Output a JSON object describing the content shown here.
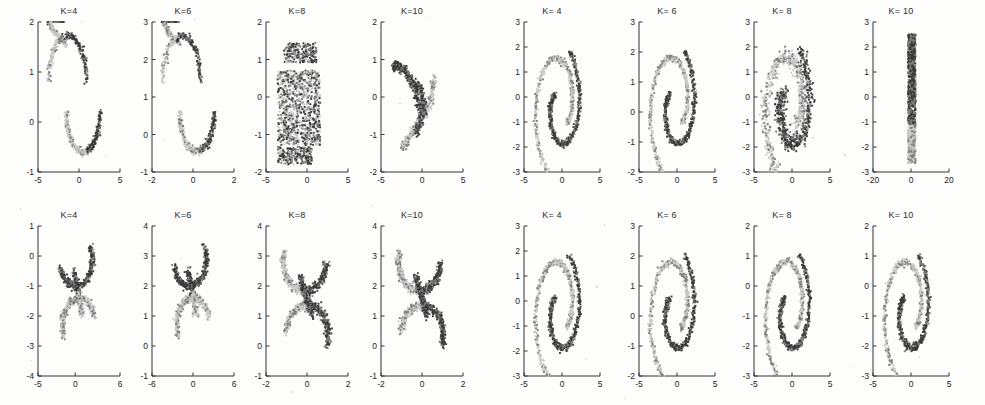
{
  "figure": {
    "background": "#fdfdfc",
    "width": 985,
    "height": 405,
    "groups": [
      {
        "id": "group-left",
        "name": "two-moons-clustering-group"
      },
      {
        "id": "group-right",
        "name": "spiral-clustering-group"
      }
    ]
  },
  "colors": {
    "dark_cluster": "#3a3a3a",
    "mid_cluster": "#7d7d7d",
    "light_cluster": "#c9c9c9",
    "axis": "#333333",
    "text": "#232323",
    "background": "#fdfdfc"
  },
  "chart_data": [
    {
      "id": "left-r0c0",
      "type": "scatter",
      "title": "K=4",
      "xlabel": "",
      "ylabel": "",
      "xlim": [
        -5,
        5
      ],
      "ylim": [
        -1,
        2
      ],
      "xticks": [
        -5,
        0,
        5
      ],
      "yticks": [
        -1,
        0,
        1,
        2
      ],
      "grid": false,
      "legend": "none",
      "shape": "two-moons",
      "series": [
        {
          "name": "cluster-dark",
          "color": "#3a3a3a",
          "points": 220
        },
        {
          "name": "cluster-light",
          "color": "#c9c9c9",
          "points": 220
        }
      ]
    },
    {
      "id": "left-r0c1",
      "type": "scatter",
      "title": "K=6",
      "xlabel": "",
      "ylabel": "",
      "xlim": [
        -2,
        2
      ],
      "ylim": [
        -1,
        3
      ],
      "xticks": [
        -2,
        0,
        2
      ],
      "yticks": [
        -1,
        0,
        1,
        2,
        3
      ],
      "grid": false,
      "legend": "none",
      "shape": "two-moons",
      "series": [
        {
          "name": "cluster-dark",
          "color": "#3a3a3a",
          "points": 220
        },
        {
          "name": "cluster-light",
          "color": "#c9c9c9",
          "points": 220
        }
      ]
    },
    {
      "id": "left-r0c2",
      "type": "scatter",
      "title": "K=8",
      "xlabel": "",
      "ylabel": "",
      "xlim": [
        -5,
        5
      ],
      "ylim": [
        -2,
        2
      ],
      "xticks": [
        -5,
        0,
        5
      ],
      "yticks": [
        -2,
        -1,
        0,
        1,
        2
      ],
      "grid": false,
      "legend": "none",
      "shape": "noise-blob",
      "series": [
        {
          "name": "cluster-dark",
          "color": "#3a3a3a",
          "points": 600
        },
        {
          "name": "cluster-light",
          "color": "#c9c9c9",
          "points": 600
        }
      ]
    },
    {
      "id": "left-r0c3",
      "type": "scatter",
      "title": "K=10",
      "xlabel": "",
      "ylabel": "",
      "xlim": [
        -5,
        5
      ],
      "ylim": [
        -2,
        2
      ],
      "xticks": [
        -5,
        0,
        5
      ],
      "yticks": [
        -2,
        -1,
        0,
        1,
        2
      ],
      "grid": false,
      "legend": "none",
      "shape": "two-moons-tilted",
      "series": [
        {
          "name": "cluster-dark",
          "color": "#3a3a3a",
          "points": 260
        },
        {
          "name": "cluster-light",
          "color": "#c9c9c9",
          "points": 260
        }
      ]
    },
    {
      "id": "left-r1c0",
      "type": "scatter",
      "title": "K=4",
      "xlabel": "",
      "ylabel": "",
      "xlim": [
        -5,
        6
      ],
      "ylim": [
        -4,
        1
      ],
      "xticks": [
        -5,
        0,
        6
      ],
      "yticks": [
        -4,
        -3,
        -2,
        -1,
        0,
        1
      ],
      "grid": false,
      "legend": "none",
      "shape": "s-curve",
      "series": [
        {
          "name": "cluster-dark",
          "color": "#3a3a3a",
          "points": 220
        },
        {
          "name": "cluster-light",
          "color": "#c9c9c9",
          "points": 220
        }
      ]
    },
    {
      "id": "left-r1c1",
      "type": "scatter",
      "title": "K=6",
      "xlabel": "",
      "ylabel": "",
      "xlim": [
        -6,
        6
      ],
      "ylim": [
        -1,
        4
      ],
      "xticks": [
        -6,
        0,
        6
      ],
      "yticks": [
        -1,
        0,
        1,
        2,
        3,
        4
      ],
      "grid": false,
      "legend": "none",
      "shape": "s-curve",
      "series": [
        {
          "name": "cluster-dark",
          "color": "#3a3a3a",
          "points": 220
        },
        {
          "name": "cluster-light",
          "color": "#c9c9c9",
          "points": 220
        }
      ]
    },
    {
      "id": "left-r1c2",
      "type": "scatter",
      "title": "K=8",
      "xlabel": "",
      "ylabel": "",
      "xlim": [
        -2,
        2
      ],
      "ylim": [
        -1,
        4
      ],
      "xticks": [
        -2,
        0,
        2
      ],
      "yticks": [
        -1,
        0,
        1,
        2,
        3,
        4
      ],
      "grid": false,
      "legend": "none",
      "shape": "s-curve-wide",
      "series": [
        {
          "name": "cluster-dark",
          "color": "#3a3a3a",
          "points": 300
        },
        {
          "name": "cluster-light",
          "color": "#c9c9c9",
          "points": 300
        }
      ]
    },
    {
      "id": "left-r1c3",
      "type": "scatter",
      "title": "K=10",
      "xlabel": "",
      "ylabel": "",
      "xlim": [
        -2,
        2
      ],
      "ylim": [
        -1,
        4
      ],
      "xticks": [
        -2,
        0,
        2
      ],
      "yticks": [
        -1,
        0,
        1,
        2,
        3,
        4
      ],
      "grid": false,
      "legend": "none",
      "shape": "s-curve-wide",
      "series": [
        {
          "name": "cluster-dark",
          "color": "#3a3a3a",
          "points": 300
        },
        {
          "name": "cluster-light",
          "color": "#c9c9c9",
          "points": 300
        }
      ]
    },
    {
      "id": "right-r0c0",
      "type": "scatter",
      "title": "K= 4",
      "xlabel": "",
      "ylabel": "",
      "xlim": [
        -5,
        5
      ],
      "ylim": [
        -3,
        3
      ],
      "xticks": [
        -5,
        0,
        5
      ],
      "yticks": [
        -3,
        -2,
        -1,
        0,
        1,
        2,
        3
      ],
      "grid": false,
      "legend": "none",
      "shape": "spiral-2arm",
      "series": [
        {
          "name": "cluster-dark",
          "color": "#3a3a3a",
          "points": 320
        },
        {
          "name": "cluster-light",
          "color": "#c9c9c9",
          "points": 320
        }
      ]
    },
    {
      "id": "right-r0c1",
      "type": "scatter",
      "title": "K= 6",
      "xlabel": "",
      "ylabel": "",
      "xlim": [
        -5,
        5
      ],
      "ylim": [
        -2,
        3
      ],
      "xticks": [
        -5,
        0,
        5
      ],
      "yticks": [
        -2,
        -1,
        0,
        1,
        2,
        3
      ],
      "grid": false,
      "legend": "none",
      "shape": "spiral-2arm",
      "series": [
        {
          "name": "cluster-dark",
          "color": "#3a3a3a",
          "points": 320
        },
        {
          "name": "cluster-light",
          "color": "#c9c9c9",
          "points": 320
        }
      ]
    },
    {
      "id": "right-r0c2",
      "type": "scatter",
      "title": "K= 8",
      "xlabel": "",
      "ylabel": "",
      "xlim": [
        -5,
        5
      ],
      "ylim": [
        -3,
        3
      ],
      "xticks": [
        -5,
        0,
        5
      ],
      "yticks": [
        -3,
        -2,
        -1,
        0,
        1,
        2,
        3
      ],
      "grid": false,
      "legend": "none",
      "shape": "spiral-2arm-noisy",
      "series": [
        {
          "name": "cluster-dark",
          "color": "#3a3a3a",
          "points": 420
        },
        {
          "name": "cluster-light",
          "color": "#c9c9c9",
          "points": 420
        }
      ]
    },
    {
      "id": "right-r0c3",
      "type": "scatter",
      "title": "K= 10",
      "xlabel": "",
      "ylabel": "",
      "xlim": [
        -20,
        20
      ],
      "ylim": [
        -3,
        3
      ],
      "xticks": [
        -20,
        0,
        20
      ],
      "yticks": [
        -3,
        -2,
        -1,
        0,
        1,
        2,
        3
      ],
      "grid": false,
      "legend": "none",
      "shape": "vertical-band",
      "series": [
        {
          "name": "cluster-dark",
          "color": "#3a3a3a",
          "points": 700
        },
        {
          "name": "cluster-light",
          "color": "#c9c9c9",
          "points": 700
        }
      ]
    },
    {
      "id": "right-r1c0",
      "type": "scatter",
      "title": "K= 4",
      "xlabel": "",
      "ylabel": "",
      "xlim": [
        -5,
        5
      ],
      "ylim": [
        -3,
        3
      ],
      "xticks": [
        -5,
        0,
        5
      ],
      "yticks": [
        -3,
        -2,
        -1,
        0,
        1,
        2,
        3
      ],
      "grid": false,
      "legend": "none",
      "shape": "spiral-2arm-clean",
      "series": [
        {
          "name": "cluster-dark",
          "color": "#3a3a3a",
          "points": 320
        },
        {
          "name": "cluster-light",
          "color": "#c9c9c9",
          "points": 320
        }
      ]
    },
    {
      "id": "right-r1c1",
      "type": "scatter",
      "title": "K= 6",
      "xlabel": "",
      "ylabel": "",
      "xlim": [
        -5,
        5
      ],
      "ylim": [
        -2,
        3
      ],
      "xticks": [
        -5,
        0,
        5
      ],
      "yticks": [
        -2,
        -1,
        0,
        1,
        2,
        3
      ],
      "grid": false,
      "legend": "none",
      "shape": "spiral-2arm-clean",
      "series": [
        {
          "name": "cluster-dark",
          "color": "#3a3a3a",
          "points": 320
        },
        {
          "name": "cluster-light",
          "color": "#c9c9c9",
          "points": 320
        }
      ]
    },
    {
      "id": "right-r1c2",
      "type": "scatter",
      "title": "K= 8",
      "xlabel": "",
      "ylabel": "",
      "xlim": [
        -5,
        5
      ],
      "ylim": [
        -3,
        2
      ],
      "xticks": [
        -5,
        0,
        5
      ],
      "yticks": [
        -3,
        -2,
        -1,
        0,
        1,
        2
      ],
      "grid": false,
      "legend": "none",
      "shape": "spiral-2arm-clean",
      "series": [
        {
          "name": "cluster-dark",
          "color": "#3a3a3a",
          "points": 320
        },
        {
          "name": "cluster-light",
          "color": "#c9c9c9",
          "points": 320
        }
      ]
    },
    {
      "id": "right-r1c3",
      "type": "scatter",
      "title": "K= 10",
      "xlabel": "",
      "ylabel": "",
      "xlim": [
        -5,
        5
      ],
      "ylim": [
        -3,
        2
      ],
      "xticks": [
        -5,
        0,
        5
      ],
      "yticks": [
        -3,
        -2,
        -1,
        0,
        1,
        2
      ],
      "grid": false,
      "legend": "none",
      "shape": "spiral-2arm-clean",
      "series": [
        {
          "name": "cluster-dark",
          "color": "#3a3a3a",
          "points": 320
        },
        {
          "name": "cluster-light",
          "color": "#c9c9c9",
          "points": 320
        }
      ]
    }
  ]
}
